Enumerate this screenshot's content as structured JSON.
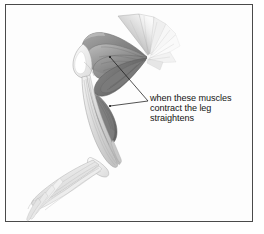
{
  "figure": {
    "background_color": "#fdfdfd",
    "frame_color": "#4a4a4a"
  },
  "annotation": {
    "text": "when these muscles\ncontract the leg\nstraightens",
    "lines": [
      "when these muscles",
      "contract the leg",
      "straightens"
    ],
    "color": "#141414",
    "font_size_px": 9
  },
  "leaders": [
    {
      "name": "upper-muscle-leader",
      "from": {
        "x": 110,
        "y": 57
      },
      "to": {
        "x": 148,
        "y": 101
      },
      "color": "#1a1a1a"
    },
    {
      "name": "lower-muscle-leader",
      "from": {
        "x": 110,
        "y": 106
      },
      "to": {
        "x": 148,
        "y": 101
      },
      "color": "#1a1a1a"
    }
  ],
  "palette": {
    "muscle_dark": "#6f6f6f",
    "muscle_mid": "#8f8f8f",
    "muscle_light": "#b4b4b4",
    "tendon": "#dcdcdc",
    "bone": "#f0f0f0",
    "outline": "#5a5a5a",
    "foot": "#e8e8e8"
  },
  "parts": [
    {
      "name": "upper-tendon-fan",
      "tone": "light"
    },
    {
      "name": "thigh-muscle-group",
      "tone": "mid"
    },
    {
      "name": "hamstring-muscle",
      "tone": "dark"
    },
    {
      "name": "knee-joint",
      "tone": "bone"
    },
    {
      "name": "calf-muscle",
      "tone": "dark"
    },
    {
      "name": "shin-tendon-bundle",
      "tone": "tendon"
    },
    {
      "name": "ankle-joint",
      "tone": "bone"
    },
    {
      "name": "foot-toes",
      "tone": "foot"
    }
  ]
}
